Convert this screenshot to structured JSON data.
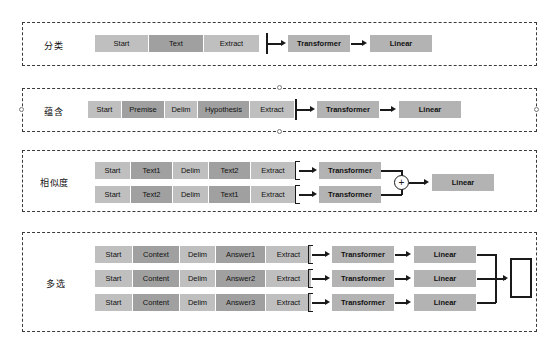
{
  "diagram": {
    "palette": {
      "token_light": "#bfbfbf",
      "token_dark": "#a0a0a0",
      "model_block": "#b3b3b3",
      "line": "#1a1a1a",
      "box_border": "#3a3a3a",
      "background": "#ffffff"
    },
    "tasks": [
      {
        "label": "分类",
        "sequences": [
          {
            "tokens": [
              {
                "text": "Start",
                "shade": "light"
              },
              {
                "text": "Text",
                "shade": "dark"
              },
              {
                "text": "Extract",
                "shade": "light"
              }
            ]
          }
        ],
        "model_blocks": [
          {
            "text": "Transformer"
          },
          {
            "text": "Linear"
          }
        ],
        "output_box": null
      },
      {
        "label": "蕴含",
        "sequences": [
          {
            "tokens": [
              {
                "text": "Start",
                "shade": "light"
              },
              {
                "text": "Premise",
                "shade": "dark"
              },
              {
                "text": "Delim",
                "shade": "light"
              },
              {
                "text": "Hypothesis",
                "shade": "dark"
              },
              {
                "text": "Extract",
                "shade": "light"
              }
            ]
          }
        ],
        "model_blocks": [
          {
            "text": "Transformer"
          },
          {
            "text": "Linear"
          }
        ],
        "output_box": null
      },
      {
        "label": "相似度",
        "sequences": [
          {
            "tokens": [
              {
                "text": "Start",
                "shade": "light"
              },
              {
                "text": "Text1",
                "shade": "dark"
              },
              {
                "text": "Delim",
                "shade": "light"
              },
              {
                "text": "Text2",
                "shade": "dark"
              },
              {
                "text": "Extract",
                "shade": "light"
              }
            ]
          },
          {
            "tokens": [
              {
                "text": "Start",
                "shade": "light"
              },
              {
                "text": "Text2",
                "shade": "dark"
              },
              {
                "text": "Delim",
                "shade": "light"
              },
              {
                "text": "Text1",
                "shade": "dark"
              },
              {
                "text": "Extract",
                "shade": "light"
              }
            ]
          }
        ],
        "model_blocks": [
          {
            "text": "Transformer"
          },
          {
            "text": "Transformer"
          },
          {
            "text": "Linear"
          }
        ],
        "sum_symbol": "+",
        "output_box": null
      },
      {
        "label": "多选",
        "sequences": [
          {
            "tokens": [
              {
                "text": "Start",
                "shade": "light"
              },
              {
                "text": "Context",
                "shade": "dark"
              },
              {
                "text": "Delim",
                "shade": "light"
              },
              {
                "text": "Answer1",
                "shade": "dark"
              },
              {
                "text": "Extract",
                "shade": "light"
              }
            ]
          },
          {
            "tokens": [
              {
                "text": "Start",
                "shade": "light"
              },
              {
                "text": "Content",
                "shade": "dark"
              },
              {
                "text": "Delim",
                "shade": "light"
              },
              {
                "text": "Answer2",
                "shade": "dark"
              },
              {
                "text": "Extract",
                "shade": "light"
              }
            ]
          },
          {
            "tokens": [
              {
                "text": "Start",
                "shade": "light"
              },
              {
                "text": "Content",
                "shade": "dark"
              },
              {
                "text": "Delim",
                "shade": "light"
              },
              {
                "text": "Answer3",
                "shade": "dark"
              },
              {
                "text": "Extract",
                "shade": "light"
              }
            ]
          }
        ],
        "model_blocks": [
          {
            "text": "Transformer"
          },
          {
            "text": "Linear"
          },
          {
            "text": "Transformer"
          },
          {
            "text": "Linear"
          },
          {
            "text": "Transformer"
          },
          {
            "text": "Linear"
          }
        ],
        "output_box": {
          "text": ""
        }
      }
    ]
  }
}
